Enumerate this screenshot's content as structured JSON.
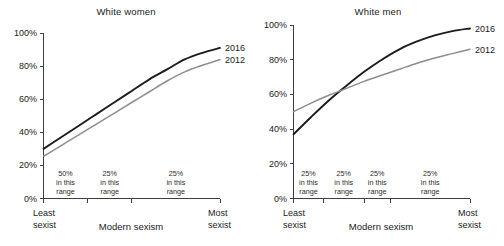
{
  "figure": {
    "background": "#ffffff",
    "text_color": "#111111"
  },
  "panels": [
    {
      "id": "white-women",
      "title": "White women",
      "xlabel": "Modern sexism",
      "x_left_line1": "Least",
      "x_left_line2": "sexist",
      "x_right_line1": "Most",
      "x_right_line2": "sexist",
      "ytick_labels": [
        "0%",
        "20%",
        "40%",
        "60%",
        "80%",
        "100%"
      ],
      "series_labels": [
        "2016",
        "2012"
      ],
      "ranges": [
        {
          "pct": "50%",
          "line2": "in this",
          "line3": "range"
        },
        {
          "pct": "25%",
          "line2": "in this",
          "line3": "range"
        },
        {
          "pct": "25%",
          "line2": "in this",
          "line3": "range"
        }
      ]
    },
    {
      "id": "white-men",
      "title": "White men",
      "xlabel": "Modern sexism",
      "x_left_line1": "Least",
      "x_left_line2": "sexist",
      "x_right_line1": "Most",
      "x_right_line2": "sexist",
      "ytick_labels": [
        "0%",
        "20%",
        "40%",
        "60%",
        "80%",
        "100%"
      ],
      "series_labels": [
        "2016",
        "2012"
      ],
      "ranges": [
        {
          "pct": "25%",
          "line2": "in this",
          "line3": "range"
        },
        {
          "pct": "25%",
          "line2": "in this",
          "line3": "range"
        },
        {
          "pct": "25%",
          "line2": "in this",
          "line3": "range"
        },
        {
          "pct": "25%",
          "line2": "in this",
          "line3": "range"
        }
      ]
    }
  ],
  "chart_data": [
    {
      "type": "line",
      "title": "White women",
      "xlabel": "Modern sexism",
      "ylabel": "",
      "ylim": [
        0,
        100
      ],
      "yticks": [
        0,
        20,
        40,
        60,
        80,
        100
      ],
      "ytick_labels": [
        "0%",
        "20%",
        "40%",
        "60%",
        "80%",
        "100%"
      ],
      "xlim": [
        0,
        100
      ],
      "x_axis_endpoints": [
        "Least sexist",
        "Most sexist"
      ],
      "x_segment_boundaries": [
        0,
        25,
        50,
        100
      ],
      "x_segment_labels": [
        "50% in this range",
        "25% in this range",
        "25% in this range"
      ],
      "grid": false,
      "legend_position": "right-end-of-lines",
      "x": [
        0,
        10,
        20,
        30,
        40,
        50,
        60,
        70,
        80,
        90,
        100
      ],
      "series": [
        {
          "name": "2016",
          "color": "#1c1c1c",
          "values": [
            30,
            37,
            44,
            51,
            58,
            65,
            72,
            78,
            84,
            88,
            91
          ]
        },
        {
          "name": "2012",
          "color": "#8d8d8d",
          "values": [
            25.5,
            32,
            38.5,
            45,
            51.5,
            58,
            64.5,
            71,
            76.5,
            80.5,
            84
          ]
        }
      ]
    },
    {
      "type": "line",
      "title": "White men",
      "xlabel": "Modern sexism",
      "ylabel": "",
      "ylim": [
        0,
        100
      ],
      "yticks": [
        0,
        20,
        40,
        60,
        80,
        100
      ],
      "ytick_labels": [
        "0%",
        "20%",
        "40%",
        "60%",
        "80%",
        "100%"
      ],
      "xlim": [
        0,
        100
      ],
      "x_axis_endpoints": [
        "Least sexist",
        "Most sexist"
      ],
      "x_segment_boundaries": [
        0,
        17,
        40,
        55,
        100
      ],
      "x_segment_labels": [
        "25% in this range",
        "25% in this range",
        "25% in this range",
        "25% in this range"
      ],
      "grid": false,
      "legend_position": "right-end-of-lines",
      "x": [
        0,
        10,
        20,
        30,
        40,
        50,
        60,
        70,
        80,
        90,
        100
      ],
      "series": [
        {
          "name": "2016",
          "color": "#1c1c1c",
          "values": [
            37,
            47,
            56.5,
            65,
            73,
            80,
            86,
            90.5,
            94,
            96.5,
            98
          ]
        },
        {
          "name": "2012",
          "color": "#8d8d8d",
          "values": [
            50,
            55,
            59.5,
            63.5,
            67.5,
            71,
            74.5,
            78,
            81,
            83.5,
            86
          ]
        }
      ]
    }
  ]
}
